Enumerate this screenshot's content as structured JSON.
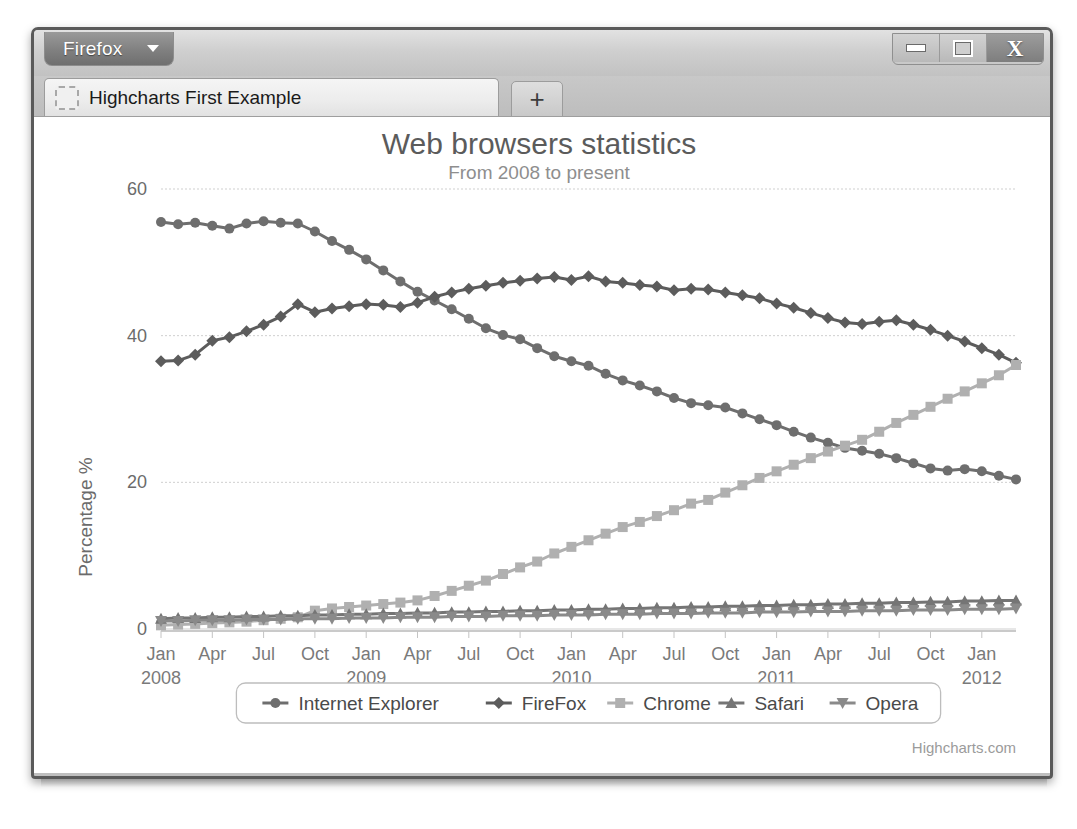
{
  "window": {
    "firefox_button": "Firefox",
    "controls": {
      "minimize": "minimize-icon",
      "maximize": "restore-icon",
      "close": "X"
    },
    "tab_title": "Highcharts First Example",
    "new_tab_label": "+"
  },
  "chart_data": {
    "type": "line",
    "title": "Web browsers statistics",
    "subtitle": "From 2008 to present",
    "xlabel": "",
    "ylabel": "Percentage %",
    "ylim": [
      0,
      60
    ],
    "yticks": [
      0,
      20,
      40,
      60
    ],
    "grid": true,
    "legend_position": "bottom",
    "credit": "Highcharts.com",
    "xtick_labels": [
      {
        "month": "Jan",
        "year": "2008"
      },
      {
        "month": "Apr",
        "year": ""
      },
      {
        "month": "Jul",
        "year": ""
      },
      {
        "month": "Oct",
        "year": ""
      },
      {
        "month": "Jan",
        "year": "2009"
      },
      {
        "month": "Apr",
        "year": ""
      },
      {
        "month": "Jul",
        "year": ""
      },
      {
        "month": "Oct",
        "year": ""
      },
      {
        "month": "Jan",
        "year": "2010"
      },
      {
        "month": "Apr",
        "year": ""
      },
      {
        "month": "Jul",
        "year": ""
      },
      {
        "month": "Oct",
        "year": ""
      },
      {
        "month": "Jan",
        "year": "2011"
      },
      {
        "month": "Apr",
        "year": ""
      },
      {
        "month": "Jul",
        "year": ""
      },
      {
        "month": "Oct",
        "year": ""
      },
      {
        "month": "Jan",
        "year": "2012"
      }
    ],
    "x_start": "2008-01",
    "x_end": "2012-03",
    "n_points": 51,
    "series": [
      {
        "name": "Internet Explorer",
        "color": "#6e6e6e",
        "marker": "circle",
        "values": [
          55.5,
          55.2,
          55.4,
          55.0,
          54.6,
          55.3,
          55.6,
          55.4,
          55.3,
          54.2,
          52.9,
          51.7,
          50.4,
          48.9,
          47.4,
          46.0,
          44.8,
          43.6,
          42.3,
          41.0,
          40.1,
          39.5,
          38.3,
          37.2,
          36.5,
          35.9,
          34.8,
          33.9,
          33.2,
          32.4,
          31.5,
          30.8,
          30.5,
          30.2,
          29.4,
          28.6,
          27.8,
          26.9,
          26.1,
          25.4,
          24.7,
          24.3,
          23.9,
          23.3,
          22.6,
          21.9,
          21.6,
          21.8,
          21.5,
          20.9,
          20.4
        ]
      },
      {
        "name": "FireFox",
        "color": "#5c5c5c",
        "marker": "diamond",
        "values": [
          36.5,
          36.6,
          37.4,
          39.3,
          39.8,
          40.6,
          41.5,
          42.6,
          44.3,
          43.2,
          43.7,
          44.0,
          44.3,
          44.2,
          43.9,
          44.5,
          45.3,
          45.9,
          46.4,
          46.8,
          47.2,
          47.5,
          47.8,
          48.0,
          47.6,
          48.1,
          47.4,
          47.2,
          46.9,
          46.7,
          46.2,
          46.4,
          46.3,
          45.9,
          45.5,
          45.1,
          44.4,
          43.8,
          43.1,
          42.4,
          41.8,
          41.6,
          41.9,
          42.1,
          41.5,
          40.8,
          40.0,
          39.2,
          38.3,
          37.4,
          36.3
        ]
      },
      {
        "name": "Chrome",
        "color": "#b0b0b0",
        "marker": "square",
        "values": [
          0.5,
          0.6,
          0.7,
          0.8,
          0.9,
          1.0,
          1.2,
          1.4,
          1.6,
          2.5,
          2.8,
          3.0,
          3.2,
          3.4,
          3.6,
          3.9,
          4.5,
          5.2,
          5.9,
          6.6,
          7.5,
          8.4,
          9.2,
          10.3,
          11.2,
          12.1,
          13.0,
          13.9,
          14.6,
          15.4,
          16.2,
          17.1,
          17.6,
          18.6,
          19.6,
          20.6,
          21.5,
          22.4,
          23.3,
          24.2,
          25.0,
          25.8,
          26.9,
          28.1,
          29.2,
          30.3,
          31.4,
          32.4,
          33.5,
          34.6,
          36.0
        ]
      },
      {
        "name": "Safari",
        "color": "#757575",
        "marker": "triangle",
        "values": [
          1.4,
          1.5,
          1.5,
          1.6,
          1.6,
          1.7,
          1.7,
          1.8,
          1.8,
          1.9,
          1.9,
          2.0,
          2.0,
          2.1,
          2.1,
          2.2,
          2.2,
          2.3,
          2.3,
          2.4,
          2.4,
          2.5,
          2.5,
          2.6,
          2.6,
          2.7,
          2.7,
          2.8,
          2.8,
          2.9,
          2.9,
          3.0,
          3.0,
          3.1,
          3.1,
          3.2,
          3.2,
          3.3,
          3.3,
          3.4,
          3.4,
          3.5,
          3.5,
          3.6,
          3.6,
          3.7,
          3.7,
          3.8,
          3.8,
          3.9,
          3.9
        ]
      },
      {
        "name": "Opera",
        "color": "#8a8a8a",
        "marker": "triangle-down",
        "values": [
          1.1,
          1.1,
          1.2,
          1.2,
          1.2,
          1.3,
          1.3,
          1.3,
          1.4,
          1.4,
          1.4,
          1.5,
          1.5,
          1.5,
          1.6,
          1.6,
          1.6,
          1.7,
          1.7,
          1.7,
          1.8,
          1.8,
          1.8,
          1.9,
          1.9,
          1.9,
          2.0,
          2.0,
          2.0,
          2.1,
          2.1,
          2.1,
          2.2,
          2.2,
          2.2,
          2.3,
          2.3,
          2.3,
          2.4,
          2.4,
          2.4,
          2.5,
          2.5,
          2.5,
          2.6,
          2.6,
          2.6,
          2.7,
          2.7,
          2.7,
          2.8
        ]
      }
    ]
  }
}
